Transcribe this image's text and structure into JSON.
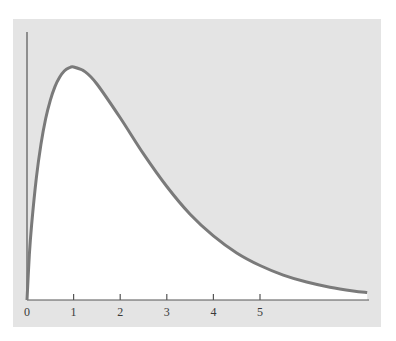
{
  "chart_data": {
    "type": "line",
    "title": "",
    "xlabel": "",
    "ylabel": "",
    "x_ticks": [
      0,
      1,
      2,
      3,
      4,
      5
    ],
    "x_tick_labels": [
      "0",
      "1",
      "2",
      "3",
      "4",
      "5"
    ],
    "xlim": [
      0,
      7.3
    ],
    "grid": false,
    "legend": null,
    "series": [
      {
        "name": "density",
        "x": [
          0,
          0.05,
          0.1,
          0.2,
          0.3,
          0.4,
          0.5,
          0.6,
          0.7,
          0.8,
          0.9,
          1.0,
          1.25,
          1.5,
          2.0,
          2.5,
          3.0,
          3.5,
          4.0,
          4.5,
          5.0,
          5.5,
          6.0,
          6.5,
          7.0,
          7.3
        ],
        "y_relative": [
          0,
          0.193,
          0.325,
          0.523,
          0.669,
          0.778,
          0.857,
          0.916,
          0.956,
          0.983,
          0.996,
          1.0,
          0.979,
          0.927,
          0.782,
          0.627,
          0.487,
          0.368,
          0.275,
          0.202,
          0.148,
          0.107,
          0.077,
          0.055,
          0.039,
          0.032
        ]
      }
    ],
    "colors": {
      "background_panel": "#e4e4e4",
      "area_fill": "#ffffff",
      "curve": "#7a7a7a",
      "axis": "#555555"
    }
  },
  "caption": {
    "text": "· · ·"
  }
}
